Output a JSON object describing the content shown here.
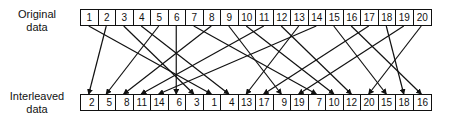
{
  "labels": {
    "original_line1": "Original",
    "original_line2": "data",
    "interleaved_line1": "Interleaved",
    "interleaved_line2": "data"
  },
  "original": [
    "1",
    "2",
    "3",
    "4",
    "5",
    "6",
    "7",
    "8",
    "9",
    "10",
    "11",
    "12",
    "13",
    "14",
    "15",
    "16",
    "17",
    "18",
    "19",
    "20"
  ],
  "interleaved": [
    "2",
    "5",
    "8",
    "11",
    "14",
    "6",
    "3",
    "1",
    "4",
    "13",
    "17",
    "9",
    "19",
    "7",
    "10",
    "12",
    "20",
    "15",
    "18",
    "16"
  ]
}
